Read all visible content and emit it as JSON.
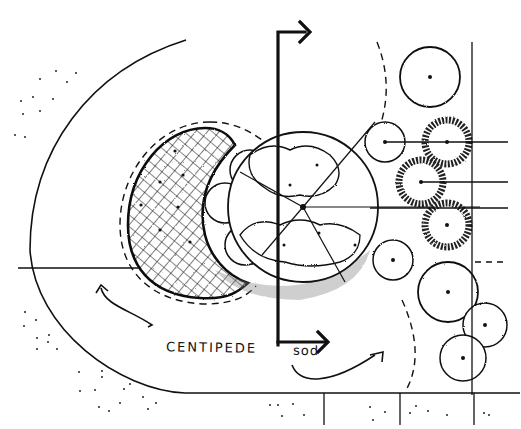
{
  "diagram": {
    "type": "landscape-plan-sketch",
    "style": "black ink hand-drawn on white",
    "labels": [
      {
        "id": "lawn-label",
        "text": "CENTIPEDE",
        "x": 166,
        "y": 338
      },
      {
        "id": "lawn-label-2",
        "text": "sod",
        "x": 292,
        "y": 342
      }
    ],
    "elements": [
      {
        "id": "lawn-edge-arc",
        "kind": "large arc (lawn boundary)"
      },
      {
        "id": "groundcover-bed",
        "kind": "crosshatched crescent bed with dashed outline"
      },
      {
        "id": "focal-circle",
        "kind": "circular bed with radial lines and shrub clusters"
      },
      {
        "id": "section-cut-line",
        "kind": "vertical line with arrows at top and bottom"
      },
      {
        "id": "right-shrub-column",
        "kind": "column of shrub symbols along fence line"
      },
      {
        "id": "paving-band",
        "kind": "bottom paving strip with joints and stippling"
      },
      {
        "id": "flow-arrows",
        "kind": "curved arrows indicating circulation"
      }
    ],
    "colors": {
      "ink": "#111111",
      "paper": "#ffffff",
      "stipple": "#333333"
    }
  }
}
